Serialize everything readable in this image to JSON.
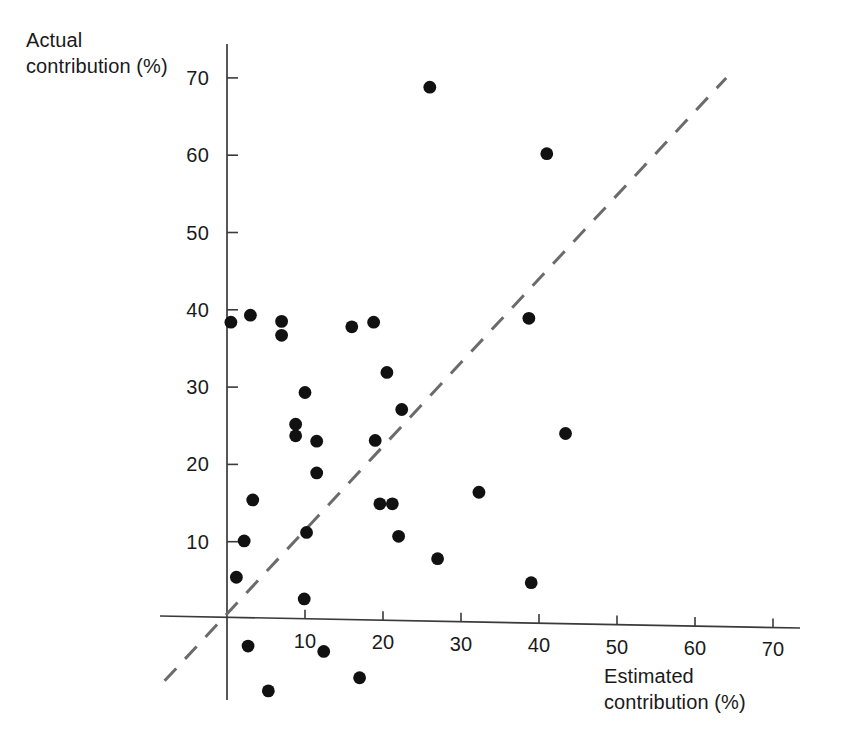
{
  "chart_data": {
    "type": "scatter",
    "title": "",
    "xlabel": "Estimated contribution (%)",
    "ylabel": "Actual contribution (%)",
    "xlim": [
      -10,
      76
    ],
    "ylim": [
      -14,
      74
    ],
    "xticks": [
      10,
      20,
      30,
      40,
      50,
      60,
      70
    ],
    "yticks": [
      10,
      20,
      30,
      40,
      50,
      60,
      70
    ],
    "xtick_labels": [
      "10",
      "20",
      "30",
      "40",
      "50",
      "60",
      "70"
    ],
    "ytick_labels": [
      "10",
      "20",
      "30",
      "40",
      "50",
      "60",
      "70"
    ],
    "grid": false,
    "legend": false,
    "marker": "filled-circle",
    "marker_color": "#111111",
    "axis_color": "#3a3a3a",
    "reference_line": {
      "label": "identity line y = x",
      "style": "dashed",
      "color": "#6b6b6b",
      "x": [
        -8,
        64
      ],
      "y": [
        -8,
        70
      ]
    },
    "series": [
      {
        "name": "respondents",
        "points": [
          [
            26.0,
            68.8
          ],
          [
            41.0,
            60.2
          ],
          [
            38.7,
            38.9
          ],
          [
            0.5,
            38.4
          ],
          [
            3.0,
            39.3
          ],
          [
            7.0,
            38.5
          ],
          [
            7.0,
            36.7
          ],
          [
            16.0,
            37.8
          ],
          [
            18.8,
            38.4
          ],
          [
            20.5,
            31.9
          ],
          [
            10.0,
            29.3
          ],
          [
            22.4,
            27.1
          ],
          [
            8.8,
            25.2
          ],
          [
            8.8,
            23.7
          ],
          [
            11.5,
            23.0
          ],
          [
            19.0,
            23.1
          ],
          [
            43.4,
            24.0
          ],
          [
            11.5,
            18.9
          ],
          [
            32.3,
            16.4
          ],
          [
            3.3,
            15.4
          ],
          [
            19.6,
            14.9
          ],
          [
            21.2,
            14.9
          ],
          [
            10.2,
            11.2
          ],
          [
            22.0,
            10.7
          ],
          [
            2.2,
            10.1
          ],
          [
            27.0,
            7.8
          ],
          [
            1.2,
            5.4
          ],
          [
            39.0,
            4.7
          ],
          [
            9.9,
            2.6
          ],
          [
            2.7,
            -3.5
          ],
          [
            12.4,
            -4.2
          ],
          [
            17.0,
            -7.6
          ],
          [
            5.3,
            -9.3
          ]
        ]
      }
    ]
  }
}
